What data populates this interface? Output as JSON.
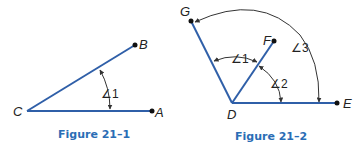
{
  "colors": {
    "ray": "#2f5fa8",
    "arc": "#333333",
    "caption": "#2a6db5",
    "point": "#111111"
  },
  "figure1": {
    "caption": "Figure 21–1",
    "points": {
      "C": "C",
      "A": "A",
      "B": "B"
    },
    "angles": [
      {
        "label": "∠1"
      }
    ]
  },
  "figure2": {
    "caption": "Figure 21–2",
    "points": {
      "D": "D",
      "E": "E",
      "F": "F",
      "G": "G"
    },
    "angles": [
      {
        "label": "∠1"
      },
      {
        "label": "∠2"
      },
      {
        "label": "∠3"
      }
    ]
  }
}
